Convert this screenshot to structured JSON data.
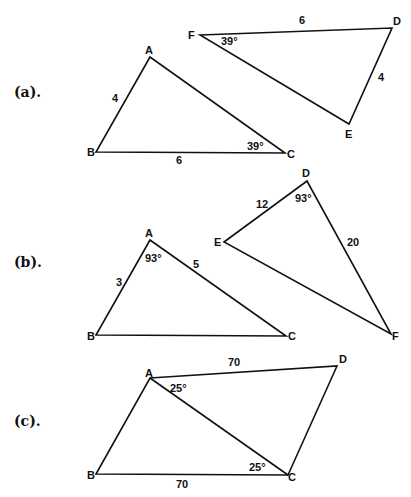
{
  "figures": [
    {
      "part_label": "(a).",
      "triangles": [
        {
          "vertices": {
            "A": "A",
            "B": "B",
            "C": "C"
          },
          "side_labels": {
            "AB": "4",
            "BC": "6"
          },
          "angle_labels": {
            "C": "39°"
          }
        },
        {
          "vertices": {
            "D": "D",
            "E": "E",
            "F": "F"
          },
          "side_labels": {
            "FD": "6",
            "DE": "4"
          },
          "angle_labels": {
            "F": "39°"
          }
        }
      ]
    },
    {
      "part_label": "(b).",
      "triangles": [
        {
          "vertices": {
            "A": "A",
            "B": "B",
            "C": "C"
          },
          "side_labels": {
            "AB": "3",
            "AC": "5"
          },
          "angle_labels": {
            "A": "93°"
          }
        },
        {
          "vertices": {
            "D": "D",
            "E": "E",
            "F": "F"
          },
          "side_labels": {
            "DE": "12",
            "DF": "20"
          },
          "angle_labels": {
            "D": "93°"
          }
        }
      ]
    },
    {
      "part_label": "(c).",
      "quadrilateral": {
        "vertices": {
          "A": "A",
          "B": "B",
          "C": "C",
          "D": "D"
        },
        "side_labels": {
          "AD": "70",
          "BC": "70"
        },
        "angle_labels": {
          "DAC": "25°",
          "ACB": "25°"
        }
      }
    }
  ]
}
